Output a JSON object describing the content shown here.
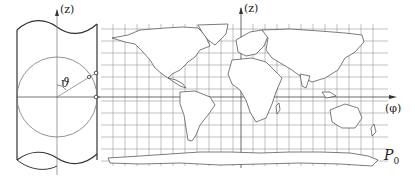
{
  "figure": {
    "cylinder": {
      "axis_label": "(z)",
      "angle_label": "ϑ"
    },
    "map": {
      "z_axis_label": "(z)",
      "phi_axis_label": "(φ)",
      "point_label": "P",
      "point_subscript": "0"
    }
  }
}
